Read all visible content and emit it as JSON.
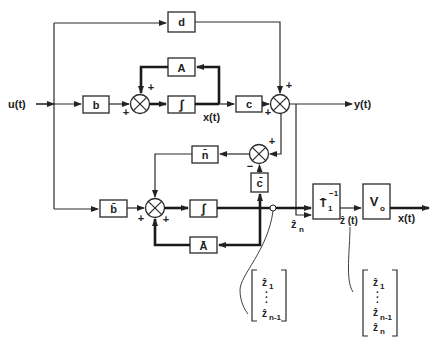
{
  "diagram": {
    "type": "block-diagram",
    "inputs": {
      "u": "u(t)"
    },
    "outputs": {
      "y": "y(t)",
      "x_out": "x(t)"
    },
    "signals": {
      "x_state": "x(t)",
      "z_hat_n": "ẑ",
      "z_hat_n_sub": "n",
      "z_hat_t": "ẑ (t)"
    },
    "blocks": {
      "d": "d",
      "A": "A",
      "b": "b",
      "integrator_top": "∫",
      "c": "c",
      "n_bar": "n̄",
      "c_bar": "c̄",
      "b_bar": "b̄",
      "integrator_bottom": "∫",
      "A_bar": "Ā",
      "T_inv": "T̄",
      "T_inv_sub": "1",
      "T_inv_sup": "−1",
      "V": "V",
      "V_sub": "o"
    },
    "summing_junctions": {
      "s1": {
        "signs": [
          "+",
          "+"
        ]
      },
      "s2": {
        "signs": [
          "+",
          "+"
        ]
      },
      "s3": {
        "signs": [
          "+",
          "−"
        ]
      },
      "s4": {
        "signs": [
          "+",
          "+"
        ]
      }
    },
    "vectors": {
      "left": {
        "items": [
          "ẑ",
          "·",
          "·",
          "·",
          "ẑ"
        ],
        "subs": [
          "1",
          "",
          "",
          "",
          "n-1"
        ]
      },
      "right": {
        "items": [
          "ẑ",
          "·",
          "·",
          "·",
          "ẑ",
          "ẑ"
        ],
        "subs": [
          "1",
          "",
          "",
          "",
          "n-1",
          "n"
        ]
      }
    }
  }
}
